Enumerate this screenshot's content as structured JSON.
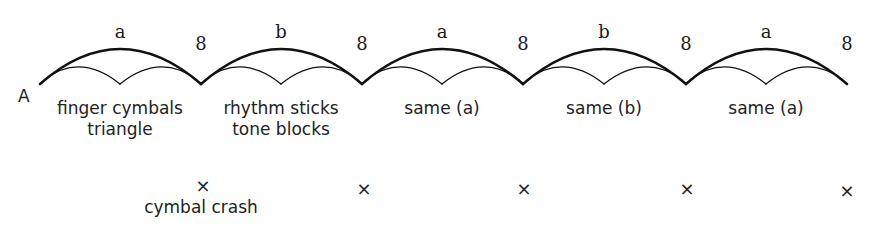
{
  "section_label": "A",
  "phrase_length_label": "8",
  "phrases": [
    {
      "letter": "a",
      "length": "8",
      "instruments": [
        "finger cymbals",
        "triangle"
      ]
    },
    {
      "letter": "b",
      "length": "8",
      "instruments": [
        "rhythm sticks",
        "tone blocks"
      ]
    },
    {
      "letter": "a",
      "length": "8",
      "instruments": [
        "same (a)"
      ]
    },
    {
      "letter": "b",
      "length": "8",
      "instruments": [
        "same (b)"
      ]
    },
    {
      "letter": "a",
      "length": "8",
      "instruments": [
        "same (a)"
      ]
    }
  ],
  "accent": {
    "symbol": "×",
    "label": "cymbal crash",
    "count": 5
  },
  "colors": {
    "stroke": "#111111",
    "text": "#222222",
    "background": "#ffffff"
  }
}
